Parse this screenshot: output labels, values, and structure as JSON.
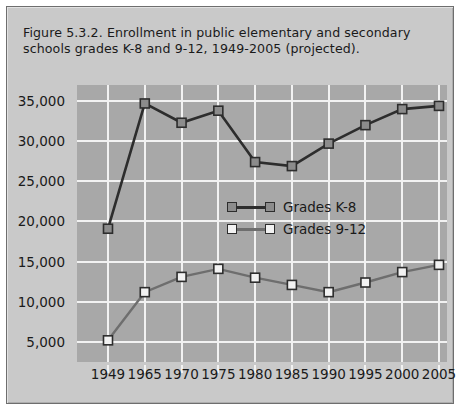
{
  "figure": {
    "caption": "Figure 5.3.2. Enrollment in public elementary and secondary schools grades K-8 and 9-12, 1949-2005 (projected)."
  },
  "colors": {
    "panel_background": "#c9c9c9",
    "plot_background": "#a8a8a8",
    "gridline": "#f2f2f2",
    "series_k8_line": "#2d2d2d",
    "series_k8_marker_fill": "#8c8c8c",
    "series_912_line": "#6e6e6e",
    "series_912_marker_fill": "#f2f2f2",
    "marker_border": "#2d2d2d",
    "text": "#1a1a1a"
  },
  "chart_data": {
    "type": "line",
    "title": "Figure 5.3.2. Enrollment in public elementary and secondary schools grades K-8 and 9-12, 1949-2005 (projected).",
    "xlabel": "",
    "ylabel": "",
    "categories": [
      "1949",
      "1965",
      "1970",
      "1975",
      "1980",
      "1985",
      "1990",
      "1995",
      "2000",
      "2005"
    ],
    "ytick_labels": [
      "5,000",
      "10,000",
      "15,000",
      "20,000",
      "25,000",
      "30,000",
      "35,000"
    ],
    "ytick_values": [
      5000,
      10000,
      15000,
      20000,
      25000,
      30000,
      35000
    ],
    "ylim": [
      2500,
      37000
    ],
    "grid": true,
    "legend_position": "center-right",
    "series": [
      {
        "name": "Grades K-8",
        "values": [
          19100,
          34700,
          32300,
          33800,
          27400,
          26900,
          29700,
          32000,
          34000,
          34400
        ]
      },
      {
        "name": "Grades 9-12",
        "values": [
          5200,
          11200,
          13100,
          14100,
          13000,
          12100,
          11200,
          12400,
          13700,
          14600
        ]
      }
    ]
  }
}
